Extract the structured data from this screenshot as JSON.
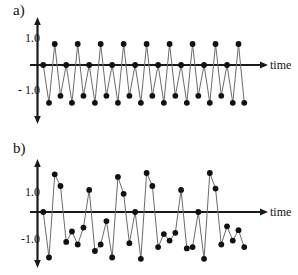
{
  "figure": {
    "title": "",
    "background_color": "#ffffff",
    "line_color": "#6b6b6b",
    "marker_color": "#111111",
    "axis_color": "#1a1a1a",
    "panels": [
      {
        "id": "a",
        "label": "a)",
        "x_axis_name": "time",
        "y_tick_labels": [
          "1.0",
          "- 1.0"
        ]
      },
      {
        "id": "b",
        "label": "b)",
        "x_axis_name": "time",
        "y_tick_labels": [
          "1.0",
          "-1.0"
        ]
      }
    ]
  },
  "chart_data": [
    {
      "type": "line",
      "title": "a)",
      "subtitle": "",
      "xlabel": "time",
      "ylabel": "",
      "grid": false,
      "legend": null,
      "markers": true,
      "marker_style": "filled-circle",
      "description": "Regular periodic sawtooth-like oscillation, 4-sample cycle repeated nine times",
      "xlim": [
        0,
        37
      ],
      "ylim": [
        -1.9,
        1.55
      ],
      "yticks": [
        1.0,
        -1.0
      ],
      "ytick_labels": [
        "1.0",
        "- 1.0"
      ],
      "xticks": [],
      "x": [
        1,
        2,
        3,
        4,
        5,
        6,
        7,
        8,
        9,
        10,
        11,
        12,
        13,
        14,
        15,
        16,
        17,
        18,
        19,
        20,
        21,
        22,
        23,
        24,
        25,
        26,
        27,
        28,
        29,
        30,
        31,
        32,
        33,
        34,
        35,
        36
      ],
      "values": [
        0.0,
        -1.35,
        0.75,
        -1.1,
        0.0,
        -1.35,
        0.75,
        -1.1,
        0.0,
        -1.35,
        0.75,
        -1.1,
        0.0,
        -1.35,
        0.75,
        -1.1,
        0.0,
        -1.35,
        0.75,
        -1.1,
        0.0,
        -1.35,
        0.75,
        -1.1,
        0.0,
        -1.35,
        0.75,
        -1.1,
        0.0,
        -1.35,
        0.75,
        -1.1,
        0.0,
        -1.35,
        0.75,
        -1.35
      ]
    },
    {
      "type": "line",
      "title": "b)",
      "subtitle": "",
      "xlabel": "time",
      "ylabel": "",
      "grid": false,
      "legend": null,
      "markers": true,
      "marker_style": "filled-circle",
      "description": "Irregular noisy oscillation with variable amplitude and period",
      "xlim": [
        0,
        37
      ],
      "ylim": [
        -1.9,
        1.7
      ],
      "yticks": [
        1.0,
        -1.0
      ],
      "ytick_labels": [
        "1.0",
        "-1.0"
      ],
      "xticks": [],
      "x": [
        1,
        2,
        3,
        4,
        5,
        6,
        7,
        8,
        9,
        10,
        11,
        12,
        13,
        14,
        15,
        16,
        17,
        18,
        19,
        20,
        21,
        22,
        23,
        24,
        25,
        26,
        27,
        28,
        29,
        30,
        31,
        32,
        33,
        34,
        35,
        36
      ],
      "values": [
        0.0,
        -1.75,
        1.45,
        1.0,
        -1.15,
        -0.75,
        -1.25,
        -0.6,
        0.85,
        -1.5,
        -1.25,
        -0.35,
        -1.75,
        1.35,
        0.7,
        -1.2,
        0.0,
        -1.8,
        1.5,
        1.0,
        -1.35,
        -0.85,
        -1.1,
        -0.8,
        0.85,
        -1.4,
        -1.35,
        0.0,
        -1.8,
        1.5,
        0.9,
        -1.25,
        -0.55,
        -1.1,
        -0.7,
        -1.35
      ]
    }
  ]
}
